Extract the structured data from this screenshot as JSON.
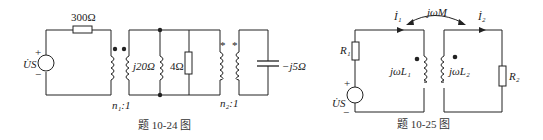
{
  "figures": [
    {
      "id": "fig-10-24",
      "caption": "题 10-24 图",
      "source_label": "U̇S",
      "source_plus": "+",
      "source_minus": "−",
      "resistor_series": "300Ω",
      "transformer1_ratio": "n₁:1",
      "inductor_label": "j20Ω",
      "resistor_shunt": "4Ω",
      "transformer2_ratio": "n₂:1",
      "capacitor_label": "−j5Ω",
      "dot_marker": "•",
      "star_marker": "*"
    },
    {
      "id": "fig-10-25",
      "caption": "题 10-25 图",
      "current1": "İ₁",
      "current2": "İ₂",
      "mutual_label": "jωM",
      "resistor1": "R₁",
      "resistor2": "R₂",
      "inductor1": "jωL₁",
      "inductor2": "jωL₂",
      "source_label": "U̇S",
      "source_plus": "+",
      "source_minus": "−"
    }
  ]
}
